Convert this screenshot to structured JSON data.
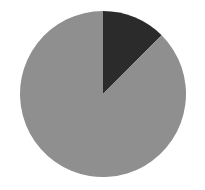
{
  "chart_data": {
    "type": "pie",
    "title": "",
    "categories": [
      "Dark slice",
      "Gray slice"
    ],
    "values": [
      12.5,
      87.5
    ],
    "colors": [
      "#2b2b2b",
      "#8f8f8f"
    ],
    "start_angle_deg": 0,
    "direction": "clockwise",
    "legend": "none",
    "labels_shown": false
  },
  "geometry": {
    "cx": 103,
    "cy": 94,
    "r": 83
  }
}
